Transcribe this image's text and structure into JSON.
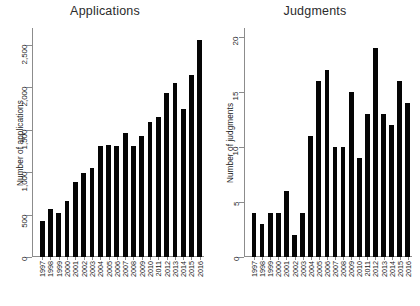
{
  "figure": {
    "background": "#ffffff",
    "bar_color": "#050505",
    "axis_color": "#8c8c8c"
  },
  "panels": [
    {
      "title": "Applications",
      "ylabel": "Number of applications"
    },
    {
      "title": "Judgments",
      "ylabel": "Number of judgments"
    }
  ],
  "chart_data": [
    {
      "type": "bar",
      "title": "Applications",
      "xlabel": "",
      "ylabel": "Number of applications",
      "ylim": [
        0,
        2700
      ],
      "yticks": [
        0,
        500,
        1000,
        1500,
        2000,
        2500
      ],
      "ytick_labels": [
        "0",
        "500",
        "1,000",
        "1,500",
        "2,000",
        "2,500"
      ],
      "grid": false,
      "legend": null,
      "categories": [
        "1997",
        "1998",
        "1999",
        "2000",
        "2001",
        "2002",
        "2003",
        "2004",
        "2005",
        "2006",
        "2007",
        "2008",
        "2009",
        "2010",
        "2011",
        "2012",
        "2013",
        "2014",
        "2015",
        "2016"
      ],
      "values": [
        430,
        565,
        520,
        660,
        890,
        985,
        1055,
        1310,
        1320,
        1310,
        1460,
        1310,
        1430,
        1590,
        1650,
        1930,
        2055,
        1745,
        2150,
        2560
      ]
    },
    {
      "type": "bar",
      "title": "Judgments",
      "xlabel": "",
      "ylabel": "Number of judgments",
      "ylim": [
        0,
        20.8
      ],
      "yticks": [
        0,
        5,
        10,
        15,
        20
      ],
      "ytick_labels": [
        "0",
        "5",
        "10",
        "15",
        "20"
      ],
      "grid": false,
      "legend": null,
      "categories": [
        "1997",
        "1998",
        "1999",
        "2000",
        "2001",
        "2002",
        "2003",
        "2004",
        "2005",
        "2006",
        "2007",
        "2008",
        "2009",
        "2010",
        "2011",
        "2012",
        "2013",
        "2014",
        "2015",
        "2016"
      ],
      "values": [
        4,
        3,
        4,
        4,
        6,
        2,
        4,
        11,
        16,
        17,
        10,
        10,
        15,
        9,
        13,
        19,
        13,
        12,
        16,
        14
      ]
    }
  ]
}
